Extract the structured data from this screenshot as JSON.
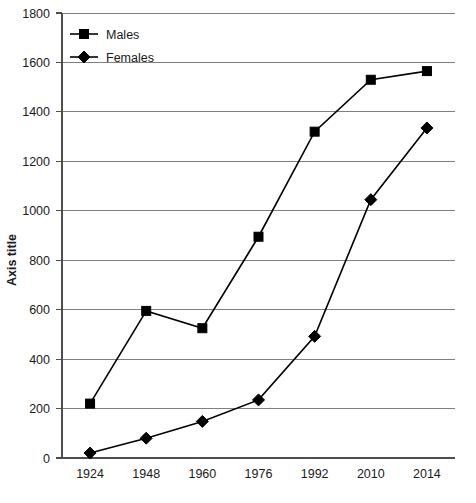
{
  "chart_data": {
    "type": "line",
    "title": "",
    "subtitle": "",
    "xlabel": "",
    "ylabel": "Axis title",
    "categories": [
      "1924",
      "1948",
      "1960",
      "1976",
      "1992",
      "2010",
      "2014"
    ],
    "series": [
      {
        "name": "Males",
        "marker": "square",
        "color": "#000000",
        "values": [
          220,
          595,
          525,
          895,
          1320,
          1530,
          1565
        ]
      },
      {
        "name": "Females",
        "marker": "diamond",
        "color": "#000000",
        "values": [
          20,
          80,
          148,
          235,
          492,
          1045,
          1335
        ]
      }
    ],
    "ylim": [
      0,
      1800
    ],
    "yticks": [
      0,
      200,
      400,
      600,
      800,
      1000,
      1200,
      1400,
      1600,
      1800
    ],
    "ytick_labels": [
      "0",
      "200",
      "400",
      "600",
      "800",
      "1000",
      "1200",
      "1400",
      "1600",
      "1800"
    ],
    "grid": true,
    "grid_axis": "y",
    "legend_position": "top-left",
    "legend_entries": [
      "Males",
      "Females"
    ]
  },
  "axes": {
    "y_title": "Axis title"
  },
  "legend": {
    "items": [
      {
        "label": "Males",
        "marker": "square"
      },
      {
        "label": "Females",
        "marker": "diamond"
      }
    ]
  },
  "colors": {
    "series": "#000000",
    "gridline": "#808080",
    "axis": "#4d4d4d",
    "background": "#ffffff"
  }
}
